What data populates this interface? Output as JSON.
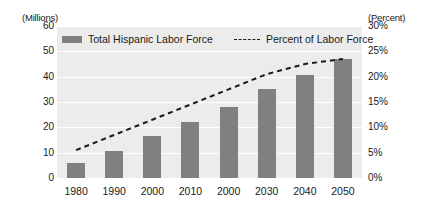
{
  "chart_data": {
    "type": "bar",
    "title": "",
    "subtitle": "",
    "xlabel": "",
    "ylabel": "(Millions)",
    "y2label": "(Percent)",
    "categories": [
      "1980",
      "1990",
      "2000",
      "2010",
      "2000",
      "2030",
      "2040",
      "2050"
    ],
    "series": [
      {
        "name": "Total Hispanic Labor Force",
        "type": "bar",
        "axis": "left",
        "unit": "millions",
        "color": "#808080",
        "values": [
          6,
          10.5,
          16.5,
          22,
          28,
          35,
          40.5,
          47
        ]
      },
      {
        "name": "Percent of Labor Force",
        "type": "line",
        "style": "dashed",
        "axis": "right",
        "unit": "percent",
        "color": "#1a1a1a",
        "values": [
          5.5,
          8.5,
          11.5,
          14.5,
          17.5,
          20.5,
          22.5,
          23.5
        ]
      }
    ],
    "ylim": [
      0,
      60
    ],
    "yticks": [
      "60",
      "50",
      "40",
      "30",
      "20",
      "10",
      "0"
    ],
    "y2lim": [
      0,
      30
    ],
    "y2ticks": [
      "30%",
      "25%",
      "20%",
      "15%",
      "10%",
      "5%",
      "0%"
    ],
    "grid": true,
    "grid_axis": "y",
    "legend_position": "top-inside",
    "plot_background": "#ececec",
    "figure_background": "#ffffff"
  },
  "axes": {
    "left_unit_caption": "(Millions)",
    "right_unit_caption": "(Percent)"
  },
  "legend": {
    "entries": [
      {
        "label": "Total Hispanic Labor Force",
        "marker": "bar-swatch"
      },
      {
        "label": "Percent of Labor Force",
        "marker": "dashed-line-swatch"
      }
    ]
  }
}
